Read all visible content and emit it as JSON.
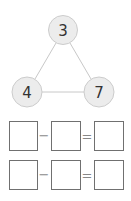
{
  "diagram": {
    "nodes": [
      {
        "id": "top",
        "value": "3",
        "cx": 63,
        "cy": 30
      },
      {
        "id": "left",
        "value": "4",
        "cx": 27,
        "cy": 92
      },
      {
        "id": "right",
        "value": "7",
        "cx": 99,
        "cy": 92
      }
    ],
    "edges": [
      [
        "top",
        "left"
      ],
      [
        "top",
        "right"
      ],
      [
        "left",
        "right"
      ]
    ],
    "colors": {
      "node_fill": "#ececec",
      "node_stroke": "#cccccc",
      "edge": "#c8c8c8",
      "box_stroke": "#707070"
    }
  },
  "equations": [
    {
      "operator": "−",
      "equals": "=",
      "boxes": [
        "",
        "",
        ""
      ]
    },
    {
      "operator": "−",
      "equals": "=",
      "boxes": [
        "",
        "",
        ""
      ]
    }
  ]
}
